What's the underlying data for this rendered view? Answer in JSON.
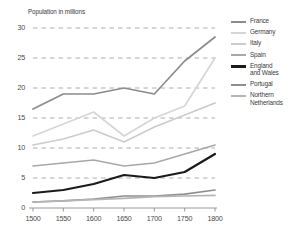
{
  "chart_data": {
    "type": "line",
    "title": "",
    "ylabel": "Population in millions",
    "xlabel": "",
    "x": [
      1500,
      1550,
      1600,
      1650,
      1700,
      1750,
      1800
    ],
    "xticklabels": [
      "1500",
      "1550",
      "1600",
      "1650",
      "1700",
      "1750",
      "1800"
    ],
    "yticklabels": [
      "0",
      "5",
      "10",
      "15",
      "20",
      "25",
      "30"
    ],
    "yticks": [
      0,
      5,
      10,
      15,
      20,
      25,
      30
    ],
    "ylim": [
      0,
      30
    ],
    "xlim": [
      1500,
      1800
    ],
    "grid": "horizontal-dashed",
    "legend_position": "right",
    "series": [
      {
        "name": "France",
        "color": "#8c8c8c",
        "width": 1.7,
        "values": [
          16.5,
          19.0,
          19.0,
          20.0,
          19.0,
          24.5,
          28.5
        ]
      },
      {
        "name": "Germany",
        "color": "#d6d6d6",
        "width": 1.7,
        "values": [
          12.0,
          14.0,
          16.0,
          12.0,
          15.0,
          17.0,
          25.0
        ]
      },
      {
        "name": "Italy",
        "color": "#cccccc",
        "width": 1.7,
        "values": [
          10.5,
          11.5,
          13.0,
          11.0,
          13.5,
          15.5,
          17.5
        ]
      },
      {
        "name": "Spain",
        "color": "#a8a8a8",
        "width": 1.7,
        "values": [
          7.0,
          7.5,
          8.0,
          7.0,
          7.5,
          9.0,
          10.5
        ]
      },
      {
        "name": "England\nand Wales",
        "color": "#1a1a1a",
        "width": 2.2,
        "values": [
          2.5,
          3.0,
          4.0,
          5.5,
          5.0,
          6.0,
          9.0
        ]
      },
      {
        "name": "Portugal",
        "color": "#8f8f8f",
        "width": 1.7,
        "values": [
          1.0,
          1.2,
          1.5,
          2.0,
          2.0,
          2.3,
          3.0
        ]
      },
      {
        "name": "Northern\nNetherlands",
        "color": "#b5b5b5",
        "width": 1.7,
        "values": [
          1.0,
          1.2,
          1.4,
          1.6,
          1.9,
          2.0,
          2.1
        ]
      }
    ]
  },
  "legend": {
    "items": [
      {
        "label": "France"
      },
      {
        "label": "Germany"
      },
      {
        "label": "Italy"
      },
      {
        "label": "Spain"
      },
      {
        "label": "England\nand Wales"
      },
      {
        "label": "Portugal"
      },
      {
        "label": "Northern\nNetherlands"
      }
    ]
  },
  "axes": {
    "y_title": "Population in millions"
  }
}
